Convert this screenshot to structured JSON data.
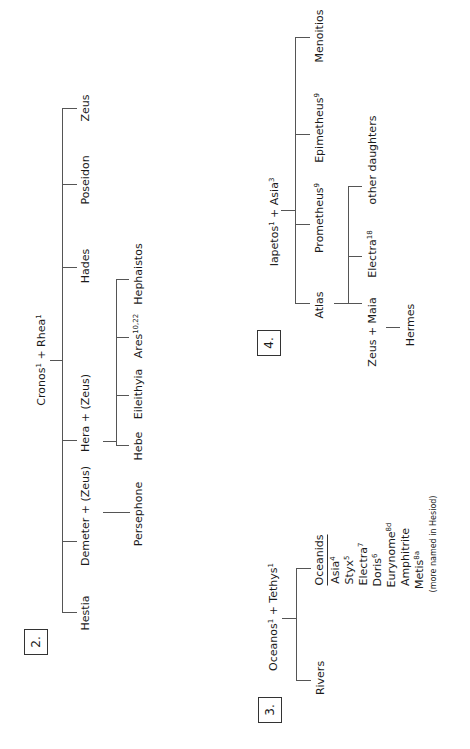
{
  "section2": {
    "number": "2.",
    "parents": {
      "name1": "Cronos",
      "sup1": "1",
      "joiner": " + ",
      "name2": "Rhea",
      "sup2": "1"
    },
    "children": {
      "zeus": "Zeus",
      "poseidon": "Poseidon",
      "hades": "Hades",
      "hera": "Hera + (Zeus)",
      "demeter": "Demeter + (Zeus)",
      "hestia": "Hestia"
    },
    "hera_children": {
      "hephaistos": "Hephaistos",
      "ares": "Ares",
      "ares_sup": "10,22",
      "eileithyia": "Eileithyia",
      "hebe": "Hebe"
    },
    "demeter_children": {
      "persephone": "Persephone"
    }
  },
  "section3": {
    "number": "3.",
    "parents": {
      "name1": "Oceanos",
      "sup1": "1",
      "joiner": " + ",
      "name2": "Tethys",
      "sup2": "1"
    },
    "rivers": "Rivers",
    "oceanids_header": "Oceanids",
    "oceanids": [
      {
        "name": "Asia",
        "sup": "4"
      },
      {
        "name": "Styx",
        "sup": "5"
      },
      {
        "name": "Electra",
        "sup": "7"
      },
      {
        "name": "Doris",
        "sup": "6"
      },
      {
        "name": "Eurynome",
        "sup": "8d"
      },
      {
        "name": "Amphitrite",
        "sup": ""
      },
      {
        "name": "Metis",
        "sup": "8a"
      }
    ],
    "note": "(more named in Hesiod)"
  },
  "section4": {
    "number": "4.",
    "parents": {
      "name1": "Iapetos",
      "sup1": "1",
      "joiner": " + ",
      "name2": "Asia",
      "sup2": "3"
    },
    "children": {
      "menoitios": "Menoitios",
      "epimetheus": "Epimetheus",
      "epimetheus_sup": "9",
      "prometheus": "Prometheus",
      "prometheus_sup": "9",
      "atlas": "Atlas"
    },
    "atlas_children": {
      "other": "other daughters",
      "electra": "Electra",
      "electra_sup": "18",
      "maia": "Zeus + Maia"
    },
    "maia_children": {
      "hermes": "Hermes"
    }
  },
  "colors": {
    "line": "#555555",
    "text": "#1a1a1a",
    "background": "#ffffff"
  }
}
